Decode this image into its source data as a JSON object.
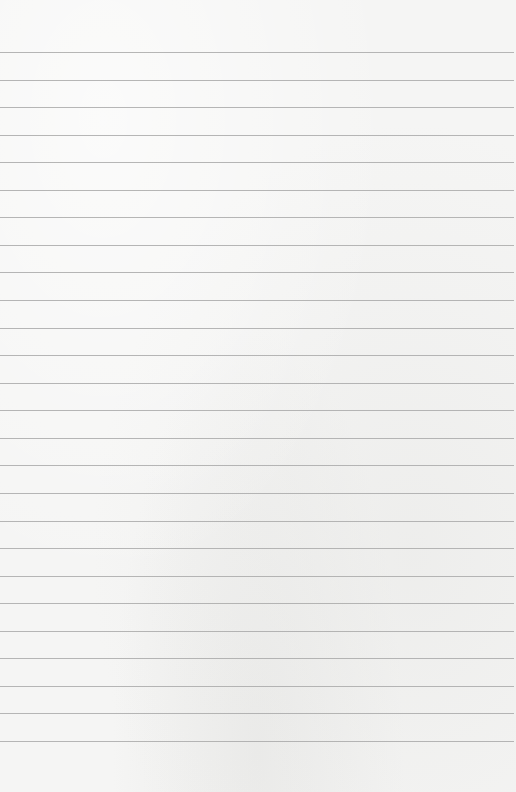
{
  "page": {
    "type": "lined-paper",
    "width": 516,
    "height": 792,
    "background_color": "#f5f5f4",
    "rule_color": "#a9a9a9",
    "rule_count": 26,
    "first_rule_y": 52,
    "rule_spacing": 27.56,
    "text_content": []
  }
}
